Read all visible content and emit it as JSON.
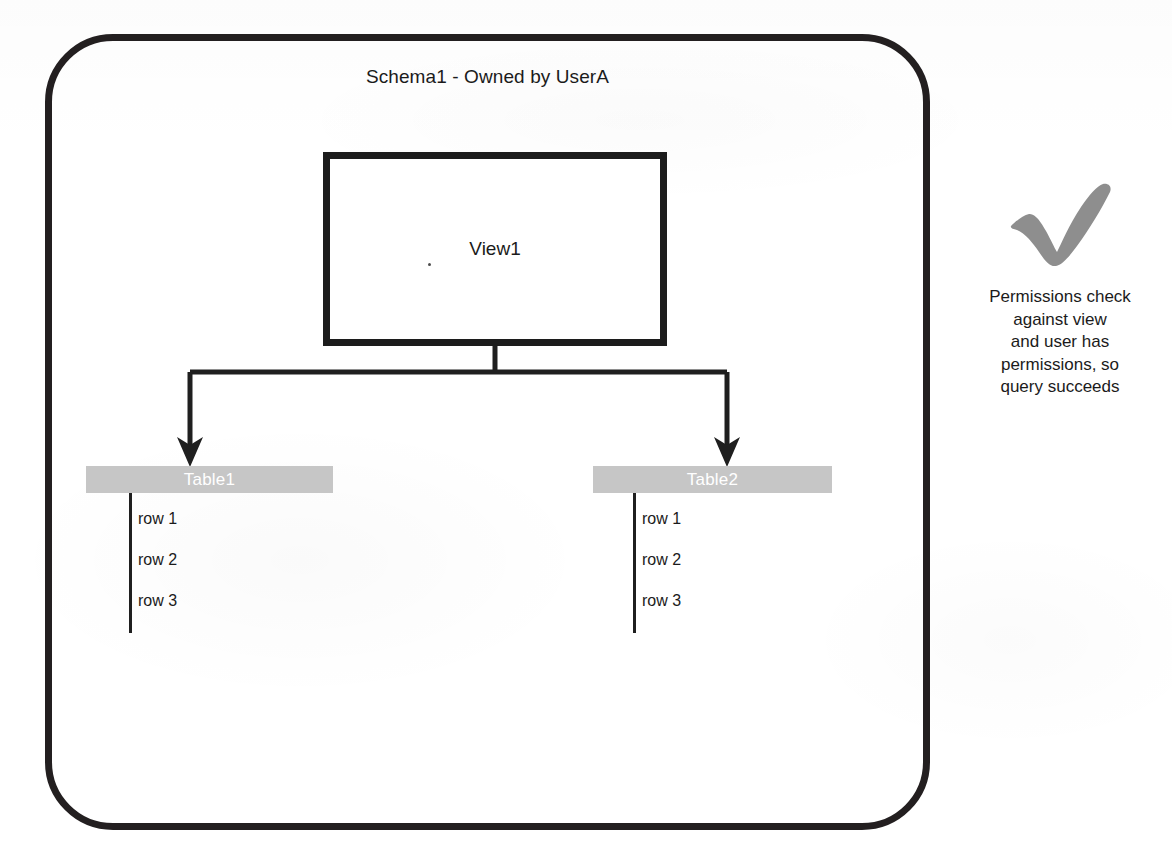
{
  "diagram": {
    "container": {
      "title": "Schema1 - Owned by UserA",
      "shape": "rounded-rectangle",
      "stroke_color": "#231f20"
    },
    "view": {
      "label": "View1",
      "shape": "rectangle",
      "stroke_color": "#1c1c1c"
    },
    "tables": [
      {
        "name": "Table1",
        "header_bg": "#c6c6c6",
        "header_text_color": "#ffffff",
        "rows": [
          "row 1",
          "row 2",
          "row 3"
        ]
      },
      {
        "name": "Table2",
        "header_bg": "#c6c6c6",
        "header_text_color": "#ffffff",
        "rows": [
          "row 1",
          "row 2",
          "row 3"
        ]
      }
    ],
    "edges": [
      {
        "from": "View1",
        "to": "Table1",
        "style": "elbow-arrow"
      },
      {
        "from": "View1",
        "to": "Table2",
        "style": "elbow-arrow"
      }
    ]
  },
  "annotation": {
    "icon": "check-mark-icon",
    "icon_color": "#8c8c8c",
    "lines": [
      "Permissions check",
      "against view",
      "and user has",
      "permissions, so",
      "query succeeds"
    ]
  }
}
